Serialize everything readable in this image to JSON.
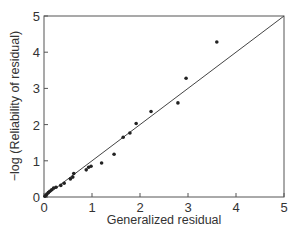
{
  "chart_data": {
    "type": "scatter",
    "title": "",
    "xlabel": "Generalized residual",
    "ylabel": "−log (Reliability of residual)",
    "xlim": [
      0,
      5
    ],
    "ylim": [
      0,
      5
    ],
    "xticks": [
      "0",
      "1",
      "2",
      "3",
      "4",
      "5"
    ],
    "yticks": [
      "0",
      "1",
      "2",
      "3",
      "4",
      "5"
    ],
    "grid": false,
    "legend": null,
    "reference_line": {
      "from": [
        0,
        0
      ],
      "to": [
        5,
        5
      ],
      "label": "y = x"
    },
    "series": [
      {
        "name": "residuals",
        "points": [
          [
            0.02,
            0.02
          ],
          [
            0.04,
            0.05
          ],
          [
            0.06,
            0.08
          ],
          [
            0.09,
            0.12
          ],
          [
            0.12,
            0.16
          ],
          [
            0.16,
            0.2
          ],
          [
            0.2,
            0.25
          ],
          [
            0.25,
            0.27
          ],
          [
            0.35,
            0.32
          ],
          [
            0.42,
            0.38
          ],
          [
            0.55,
            0.5
          ],
          [
            0.6,
            0.55
          ],
          [
            0.62,
            0.65
          ],
          [
            0.88,
            0.75
          ],
          [
            0.93,
            0.82
          ],
          [
            0.98,
            0.85
          ],
          [
            1.2,
            0.94
          ],
          [
            1.46,
            1.18
          ],
          [
            1.65,
            1.65
          ],
          [
            1.79,
            1.77
          ],
          [
            1.92,
            2.03
          ],
          [
            2.23,
            2.36
          ],
          [
            2.79,
            2.6
          ],
          [
            2.96,
            3.28
          ],
          [
            3.6,
            4.28
          ]
        ]
      }
    ]
  },
  "colors": {
    "axis": "#555555",
    "marker": "#222222",
    "line": "#444444",
    "text": "#333333"
  }
}
